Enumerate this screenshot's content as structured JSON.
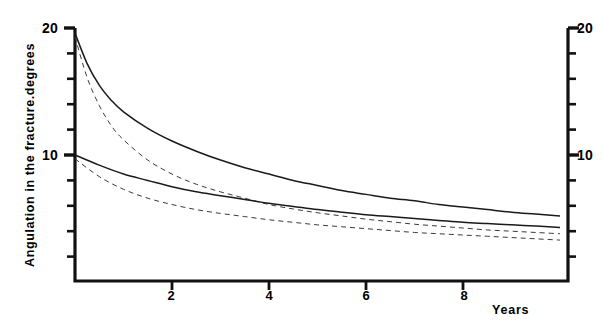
{
  "chart_data": {
    "type": "line",
    "title": "",
    "xlabel": "Years",
    "ylabel": "Angulation in the fracture.degrees",
    "xlim": [
      0,
      10.2
    ],
    "ylim": [
      0,
      20.8
    ],
    "xticks": [
      2,
      4,
      6,
      8
    ],
    "xtick_labels": [
      "2",
      "4",
      "6",
      "8"
    ],
    "yticks": [
      2,
      4,
      6,
      8,
      10,
      12,
      14,
      16,
      18,
      20
    ],
    "ytick_labels_shown": [
      "10",
      "20"
    ],
    "y_labeled_values": [
      10,
      20
    ],
    "grid": false,
    "legend": "none",
    "axis_right_mirrored": true,
    "right_axis_labels": [
      "10",
      "20"
    ],
    "series": [
      {
        "name": "upper-solid",
        "style": "solid",
        "color": "#1a1a1a",
        "x": [
          0,
          0.25,
          0.5,
          0.75,
          1,
          1.5,
          2,
          2.5,
          3,
          3.5,
          4,
          4.5,
          5,
          5.5,
          6,
          6.5,
          7,
          7.5,
          8,
          8.5,
          9,
          9.5,
          10
        ],
        "y": [
          19.6,
          17.2,
          15.5,
          14.3,
          13.4,
          12.1,
          11.1,
          10.3,
          9.6,
          9.0,
          8.5,
          8.0,
          7.6,
          7.2,
          6.9,
          6.6,
          6.4,
          6.1,
          5.9,
          5.7,
          5.5,
          5.35,
          5.2
        ]
      },
      {
        "name": "upper-dashed",
        "style": "dashed",
        "color": "#3a3a3a",
        "x": [
          0,
          0.25,
          0.5,
          0.75,
          1,
          1.5,
          2,
          2.5,
          3,
          3.5,
          4,
          4.5,
          5,
          5.5,
          6,
          6.5,
          7,
          7.5,
          8,
          8.5,
          9,
          9.5,
          10
        ],
        "y": [
          19.3,
          16.1,
          13.9,
          12.3,
          11.2,
          9.6,
          8.5,
          7.7,
          7.1,
          6.6,
          6.1,
          5.75,
          5.45,
          5.2,
          4.95,
          4.75,
          4.55,
          4.4,
          4.25,
          4.1,
          4.0,
          3.9,
          3.8
        ]
      },
      {
        "name": "lower-solid",
        "style": "solid",
        "color": "#1a1a1a",
        "x": [
          0,
          0.5,
          1,
          1.5,
          2,
          2.5,
          3,
          3.5,
          4,
          4.5,
          5,
          5.5,
          6,
          6.5,
          7,
          7.5,
          8,
          8.5,
          9,
          9.5,
          10
        ],
        "y": [
          10.0,
          9.2,
          8.5,
          8.0,
          7.5,
          7.1,
          6.8,
          6.5,
          6.2,
          5.95,
          5.7,
          5.5,
          5.3,
          5.15,
          5.0,
          4.85,
          4.7,
          4.6,
          4.5,
          4.4,
          4.3
        ]
      },
      {
        "name": "lower-dashed",
        "style": "dashed",
        "color": "#3a3a3a",
        "x": [
          0,
          0.5,
          1,
          1.5,
          2,
          2.5,
          3,
          3.5,
          4,
          4.5,
          5,
          5.5,
          6,
          6.5,
          7,
          7.5,
          8,
          8.5,
          9,
          9.5,
          10
        ],
        "y": [
          9.7,
          8.3,
          7.3,
          6.6,
          6.1,
          5.7,
          5.4,
          5.15,
          4.9,
          4.7,
          4.5,
          4.35,
          4.2,
          4.05,
          3.9,
          3.8,
          3.7,
          3.6,
          3.5,
          3.4,
          3.3
        ]
      }
    ]
  },
  "axes": {
    "y_left_top_label": "20",
    "y_left_mid_label": "10",
    "y_right_top_label": "20",
    "y_right_mid_label": "10",
    "y_title": "Angulation in the fracture.degrees",
    "x_title": "Years",
    "x_tick_1": "2",
    "x_tick_2": "4",
    "x_tick_3": "6",
    "x_tick_4": "8"
  },
  "colors": {
    "axis": "#111111",
    "solid_curve": "#1a1a1a",
    "dashed_curve": "#3a3a3a",
    "background": "#ffffff"
  }
}
